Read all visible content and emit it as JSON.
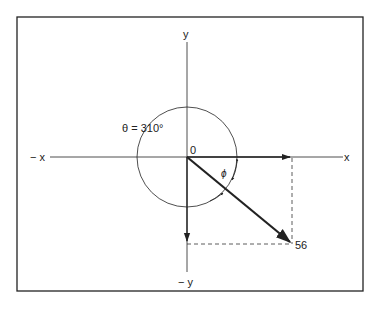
{
  "diagram": {
    "labels": {
      "y_pos": "y",
      "y_neg": "− y",
      "x_pos": "x",
      "x_neg": "− x",
      "origin": "0",
      "theta": "θ = 310°",
      "phi": "ϕ",
      "vector_tip": "56"
    },
    "colors": {
      "line": "#222222",
      "frame": "#222222",
      "background": "#ffffff"
    }
  }
}
